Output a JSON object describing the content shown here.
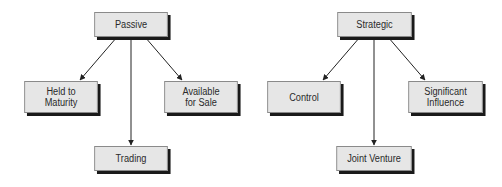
{
  "diagrams": [
    {
      "name": "passive",
      "root": {
        "label": "Passive"
      },
      "children": [
        {
          "label": "Held to\nMaturity"
        },
        {
          "label": "Available\nfor Sale"
        },
        {
          "label": "Trading"
        }
      ]
    },
    {
      "name": "strategic",
      "root": {
        "label": "Strategic"
      },
      "children": [
        {
          "label": "Control"
        },
        {
          "label": "Significant\nInfluence"
        },
        {
          "label": "Joint Venture"
        }
      ]
    }
  ],
  "colors": {
    "box_fill": "#e6e6e6",
    "box_border": "#8a8a8a",
    "shadow": "#1a1a1a",
    "line": "#222222",
    "text": "#2a2a2a"
  }
}
